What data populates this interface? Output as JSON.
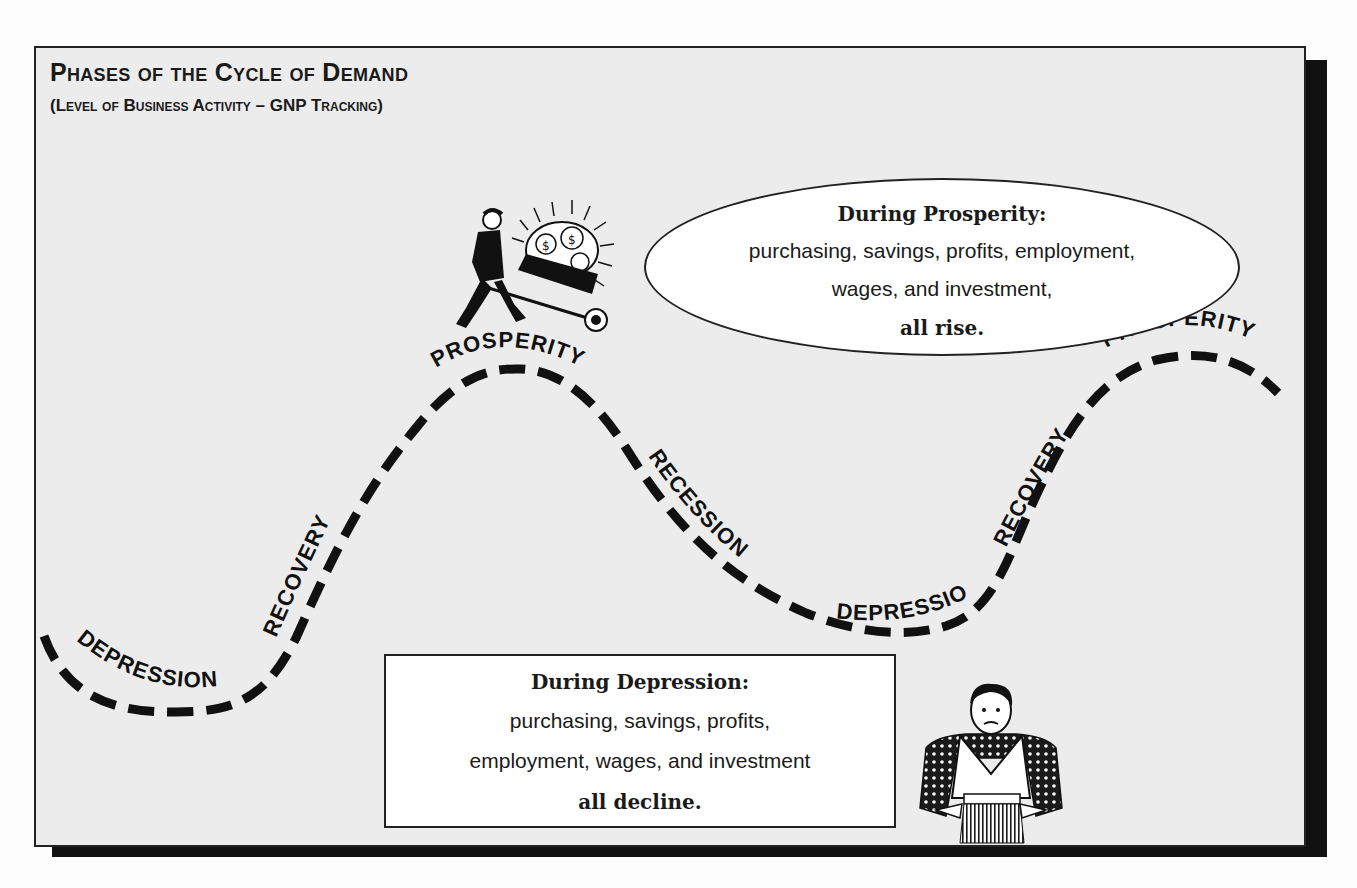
{
  "header": {
    "title": "Phases of the Cycle of Demand",
    "subtitle": "(Level of Business Activity – GNP Tracking)"
  },
  "phase_labels": [
    {
      "id": "depression-1",
      "label": "Depression"
    },
    {
      "id": "recovery-1",
      "label": "Recovery"
    },
    {
      "id": "prosperity-1",
      "label": "Prosperity"
    },
    {
      "id": "recession-1",
      "label": "Recession"
    },
    {
      "id": "depression-2",
      "label": "Depression"
    },
    {
      "id": "recovery-2",
      "label": "Recovery"
    },
    {
      "id": "prosperity-2",
      "label": "Prosperity"
    }
  ],
  "callouts": {
    "prosperity": {
      "heading": "During Prosperity:",
      "body_line1": "purchasing, savings, profits, employment,",
      "body_line2": "wages, and investment,",
      "footer": "all rise."
    },
    "depression": {
      "heading": "During Depression:",
      "body_line1": "purchasing, savings, profits,",
      "body_line2": "employment, wages, and investment",
      "footer": "all decline."
    }
  },
  "illustrations": {
    "prosperity_figure": "man-with-wheelbarrow-of-money",
    "depression_figure": "man-with-empty-pockets"
  },
  "colors": {
    "background": "#ececec",
    "ink": "#1a1a1a",
    "shadow": "#111111",
    "callout_fill": "#ffffff"
  }
}
